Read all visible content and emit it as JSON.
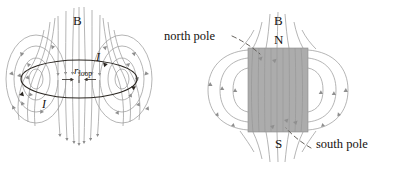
{
  "figure": {
    "title_text": "",
    "background_color": "#ffffff",
    "width": 394,
    "height": 170
  },
  "colors": {
    "field_line": "#9c9c9c",
    "field_line_dark": "#7d7d7d",
    "loop_outline": "#2b2722",
    "magnet_fill": "#9a9a9a",
    "magnet_edge": "#8a8a8a",
    "text": "#16120f",
    "leader": "#55504b"
  },
  "left_panel": {
    "name": "current-loop-field-diagram",
    "labels": {
      "field_symbol": "B",
      "current_top": "I",
      "current_bottom": "I",
      "radius_symbol": "r",
      "radius_subscript": "loop"
    }
  },
  "right_panel": {
    "name": "bar-magnet-field-diagram",
    "labels": {
      "field_symbol": "B",
      "north_letter": "N",
      "south_letter": "S",
      "north_pole_caption": "north pole",
      "south_pole_caption": "south pole"
    }
  }
}
